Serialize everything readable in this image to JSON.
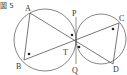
{
  "figure": {
    "caption": "圖 5",
    "labels": {
      "A": "A",
      "B": "B",
      "C": "C",
      "D": "D",
      "P": "P",
      "Q": "Q",
      "T": "T"
    }
  },
  "colors": {
    "stroke": "#555555",
    "text": "#333333",
    "background": "#ffffff"
  }
}
